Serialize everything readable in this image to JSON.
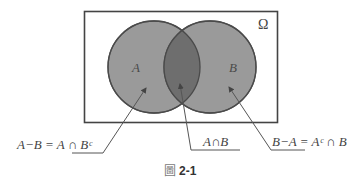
{
  "diagram": {
    "type": "venn",
    "universe_label": "Ω",
    "sets": [
      {
        "name": "A",
        "label": "A"
      },
      {
        "name": "B",
        "label": "B"
      }
    ],
    "regions": [
      {
        "id": "a-minus-b",
        "label": "A−B = A ∩ Bᶜ"
      },
      {
        "id": "a-intersect-b",
        "label": "A∩B"
      },
      {
        "id": "b-minus-a",
        "label": "B−A = Aᶜ ∩ B"
      }
    ],
    "colors": {
      "circle_fill": "#9a9a9a",
      "intersection_fill": "#6e6e6e",
      "circle_stroke": "#555555",
      "frame_stroke": "#444444",
      "arrow_stroke": "#555555"
    }
  },
  "caption": {
    "glyph": "圖",
    "number": "2-1"
  }
}
